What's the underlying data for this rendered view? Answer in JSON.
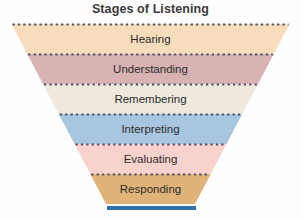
{
  "title": "Stages of Listening",
  "background_color": "#fefefe",
  "title_color": "#3b3b3b",
  "label_color": "#2b2b2b",
  "separator": {
    "style": "dotted",
    "color": "#4a4f63"
  },
  "base_bar": {
    "color": "#2f74a8",
    "x1": 107,
    "x2": 196,
    "y": 206,
    "thickness": 4
  },
  "chart_data": {
    "type": "funnel",
    "title": "Stages of Listening",
    "orientation": "vertical-inverted",
    "top_width": 278,
    "bottom_width": 89,
    "categories": [
      "Hearing",
      "Understanding",
      "Remembering",
      "Interpreting",
      "Evaluating",
      "Responding"
    ],
    "colors": [
      "#f7ddbb",
      "#d9b3b4",
      "#efe8dd",
      "#a8c6df",
      "#f8d3cd",
      "#e0b478"
    ],
    "values": [
      6,
      5,
      4,
      3,
      2,
      1
    ],
    "band_count": 6,
    "band_top_edges": [
      24,
      54,
      84,
      114,
      144,
      174
    ],
    "band_bottom_edge": 204,
    "grid": false,
    "legend": null
  },
  "bands": [
    {
      "label": "Hearing",
      "color": "#f7ddbb",
      "y_top": 24,
      "y_bottom": 54,
      "label_y": 32
    },
    {
      "label": "Understanding",
      "color": "#d9b3b4",
      "y_top": 54,
      "y_bottom": 84,
      "label_y": 62
    },
    {
      "label": "Remembering",
      "color": "#efe8dd",
      "y_top": 84,
      "y_bottom": 114,
      "label_y": 92
    },
    {
      "label": "Interpreting",
      "color": "#a8c6df",
      "y_top": 114,
      "y_bottom": 144,
      "label_y": 122
    },
    {
      "label": "Evaluating",
      "color": "#f8d3cd",
      "y_top": 144,
      "y_bottom": 174,
      "label_y": 152
    },
    {
      "label": "Responding",
      "color": "#e0b478",
      "y_top": 174,
      "y_bottom": 204,
      "label_y": 182
    }
  ]
}
